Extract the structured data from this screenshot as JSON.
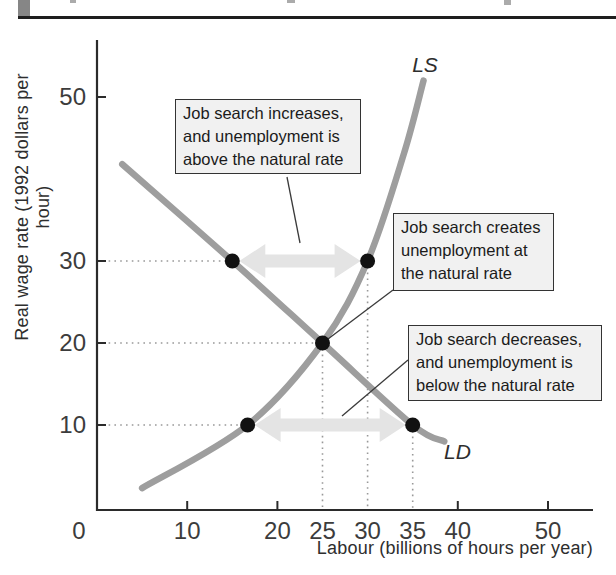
{
  "chart_data": {
    "type": "line",
    "xlabel": "Labour (billions of hours per year)",
    "ylabel": "Real wage rate (1992 dollars per hour)",
    "xlim": [
      0,
      55
    ],
    "ylim": [
      0,
      57
    ],
    "origin_label": "0",
    "x_ticks_solid": [
      10,
      20,
      40,
      50
    ],
    "x_ticks_dotted": [
      25,
      30,
      35
    ],
    "y_ticks": [
      10,
      20,
      30,
      50
    ],
    "series": [
      {
        "name": "labour-supply",
        "label": "LS",
        "points": [
          [
            5,
            2.3
          ],
          [
            16.7,
            10
          ],
          [
            25,
            20
          ],
          [
            30,
            30
          ],
          [
            34,
            43
          ],
          [
            36.2,
            52
          ]
        ]
      },
      {
        "name": "labour-demand",
        "label": "LD",
        "points": [
          [
            2.8,
            41.8
          ],
          [
            15,
            30
          ],
          [
            25,
            20
          ],
          [
            35,
            10
          ],
          [
            38.5,
            8
          ]
        ]
      }
    ],
    "markers": [
      {
        "l": 15,
        "w": 30
      },
      {
        "l": 30,
        "w": 30
      },
      {
        "l": 25,
        "w": 20
      },
      {
        "l": 16.7,
        "w": 10
      },
      {
        "l": 35,
        "w": 10
      }
    ],
    "guides_horizontal": [
      {
        "w": 30,
        "to_l": 30
      },
      {
        "w": 20,
        "to_l": 25
      },
      {
        "w": 10,
        "to_l": 35
      }
    ],
    "guides_vertical": [
      {
        "l": 25,
        "from_w": 20
      },
      {
        "l": 30,
        "from_w": 30
      },
      {
        "l": 35,
        "from_w": 10
      }
    ],
    "arrows": [
      {
        "w": 30,
        "from_l": 15,
        "to_l": 30
      },
      {
        "w": 10,
        "from_l": 16.7,
        "to_l": 35
      }
    ]
  },
  "annotations": [
    {
      "lines": [
        "Job search increases,",
        "and unemployment is",
        "above the natural rate"
      ]
    },
    {
      "lines": [
        "Job search creates",
        "unemployment at",
        "the natural rate"
      ]
    },
    {
      "lines": [
        "Job search decreases,",
        "and unemployment is",
        "below the natural rate"
      ]
    }
  ],
  "colors": {
    "curve": "#9e9e9e",
    "marker": "#111111",
    "arrow": "#e4e4e4",
    "axis": "#2b2b2b",
    "dotted": "#999999",
    "tick_text": "#3c3c3c",
    "leader": "#3a3a3a",
    "box_bg": "#f1f1f1",
    "box_border": "#333333"
  }
}
